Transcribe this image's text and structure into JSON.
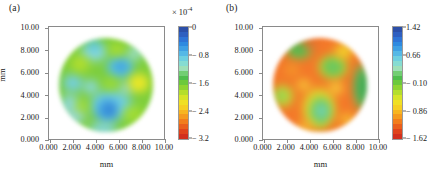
{
  "figure": {
    "panels": [
      {
        "tag": "(a)",
        "xlabel": "mm",
        "ylabel": "mm",
        "xticks": [
          "0.000",
          "2.000",
          "4.000",
          "6.000",
          "8.000",
          "10.00"
        ],
        "yticks": [
          "10.00",
          "8.000",
          "6.000",
          "4.000",
          "2.000",
          "0.000"
        ],
        "colorbar": {
          "exponent_label": "× 10",
          "exponent_power": "-4",
          "ticks": [
            "0",
            "− 0.8",
            "− 1.6",
            "− 2.4",
            "− 3.2"
          ]
        }
      },
      {
        "tag": "(b)",
        "xlabel": "mm",
        "ylabel": "",
        "xticks": [
          "0.000",
          "2.000",
          "4.000",
          "6.000",
          "8.000",
          "10.00"
        ],
        "yticks": [
          "10.00",
          "8.000",
          "6.000",
          "4.000",
          "2.000",
          "0.000"
        ],
        "colorbar": {
          "exponent_label": "",
          "exponent_power": "",
          "ticks": [
            "1.42",
            "0.66",
            "− 0.10",
            "− 0.86",
            "− 1.62"
          ]
        }
      }
    ]
  },
  "chart_data": [
    {
      "type": "heatmap",
      "title": "(a)",
      "xlabel": "mm",
      "ylabel": "mm",
      "xlim": [
        0,
        10
      ],
      "ylim": [
        0,
        10
      ],
      "xticks": [
        0,
        2,
        4,
        6,
        8,
        10
      ],
      "yticks": [
        0,
        2,
        4,
        6,
        8,
        10
      ],
      "grid": false,
      "legend_position": "right-colorbar",
      "colorbar": {
        "label_multiplier": "×10⁻⁴",
        "tick_values": [
          0,
          -0.8,
          -1.6,
          -2.4,
          -3.2
        ],
        "vmin": -3.2,
        "vmax": 0,
        "colormap": "jet"
      },
      "description": "Circular aperture map, background predominantly green (~−1.5×10⁻⁴) with several cyan/blue low-value patches",
      "region_shape": "disk",
      "disk_center": [
        5.0,
        5.0
      ],
      "disk_radius": 4.1,
      "features": [
        {
          "name": "blue-patch-upper-right",
          "x": 6.0,
          "y": 6.9,
          "value": -0.5
        },
        {
          "name": "cyan-patch-top",
          "x": 3.6,
          "y": 8.6,
          "value": -0.9
        },
        {
          "name": "blue-patch-lower-center",
          "x": 5.1,
          "y": 2.4,
          "value": -0.4
        },
        {
          "name": "cyan-patch-lower-left",
          "x": 3.0,
          "y": 3.6,
          "value": -1.0
        },
        {
          "name": "cyan-patch-left",
          "x": 1.5,
          "y": 4.3,
          "value": -1.0
        },
        {
          "name": "cyan-patch-bottom-rim",
          "x": 4.6,
          "y": 0.9,
          "value": -1.0
        },
        {
          "name": "yellow-patch-right",
          "x": 8.0,
          "y": 5.0,
          "value": -2.2
        },
        {
          "name": "yellow-patch-upper-left",
          "x": 2.2,
          "y": 7.2,
          "value": -2.0
        },
        {
          "name": "background-green",
          "x": 5.0,
          "y": 5.0,
          "value": -1.5
        }
      ]
    },
    {
      "type": "heatmap",
      "title": "(b)",
      "xlabel": "mm",
      "ylabel": "mm",
      "xlim": [
        0,
        10
      ],
      "ylim": [
        0,
        10
      ],
      "xticks": [
        0,
        2,
        4,
        6,
        8,
        10
      ],
      "yticks": [
        0,
        2,
        4,
        6,
        8,
        10
      ],
      "grid": false,
      "legend_position": "right-colorbar",
      "colorbar": {
        "label_multiplier": "",
        "tick_values": [
          1.42,
          0.66,
          -0.1,
          -0.86,
          -1.62
        ],
        "vmin": -1.62,
        "vmax": 1.42,
        "colormap": "jet"
      },
      "description": "Circular aperture map, background predominantly orange (~−1.3) with a few green/cyan high-value patches",
      "region_shape": "disk",
      "disk_center": [
        5.0,
        5.0
      ],
      "disk_radius": 4.1,
      "features": [
        {
          "name": "green-cyan-patch-upper-center",
          "x": 5.2,
          "y": 6.8,
          "value": -0.1
        },
        {
          "name": "cyan-patch-lower-center",
          "x": 5.0,
          "y": 2.6,
          "value": 0.3
        },
        {
          "name": "green-patch-top-left",
          "x": 2.6,
          "y": 8.4,
          "value": -0.2
        },
        {
          "name": "green-patch-left-rim",
          "x": 1.1,
          "y": 4.0,
          "value": -0.3
        },
        {
          "name": "green-rim-right",
          "x": 8.9,
          "y": 5.0,
          "value": -0.2
        },
        {
          "name": "yellow-patch-top-center",
          "x": 6.2,
          "y": 8.4,
          "value": -0.8
        },
        {
          "name": "yellow-streak-lower-left",
          "x": 3.6,
          "y": 3.3,
          "value": -0.7
        },
        {
          "name": "background-orange",
          "x": 5.0,
          "y": 5.0,
          "value": -1.3
        }
      ]
    }
  ]
}
